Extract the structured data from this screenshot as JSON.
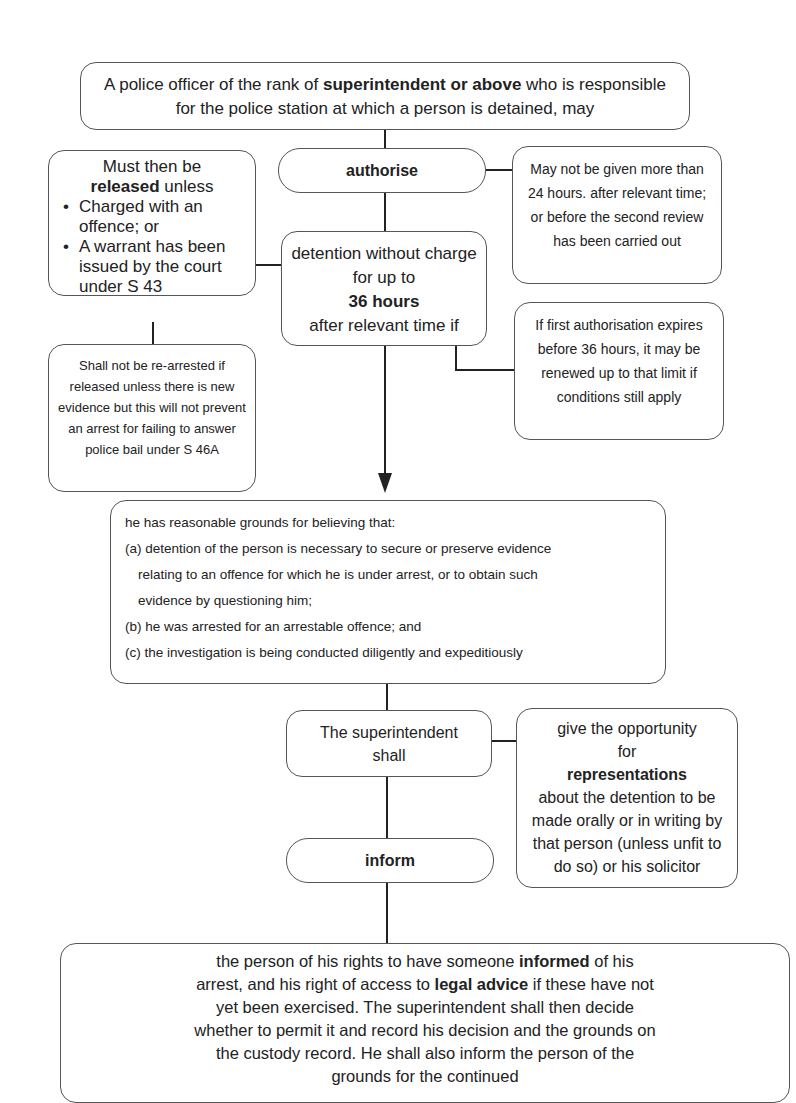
{
  "diagram": {
    "top_box": {
      "pre": "A police officer of the rank of ",
      "bold": "superintendent or above",
      "post": " who is responsible for the police station at which a person is detained, may"
    },
    "authorise_box": {
      "label": "authorise"
    },
    "release_box": {
      "line1": "Must then be",
      "bold": "released",
      "post": " unless",
      "bullets": [
        "Charged with an offence; or",
        "A warrant has been issued by the court under S 43"
      ]
    },
    "rearrest_box": {
      "text": "Shall not be re-arrested if released unless there is new evidence but this will not prevent an arrest for failing to answer police bail under S 46A"
    },
    "limit_box": {
      "text": "May not be given more than 24 hours. after relevant time; or before the second review has been carried out"
    },
    "detention_box": {
      "line1": "detention without charge for up to",
      "bold": "36 hours",
      "line3": "after relevant time if"
    },
    "renew_box": {
      "text": "If first authorisation expires before 36 hours, it may be renewed up to that limit if conditions still apply"
    },
    "grounds_box": {
      "intro": "he has reasonable grounds for believing that:",
      "items": [
        "(a) detention of the person is necessary to secure or preserve evidence",
        "relating to an offence for which he is under arrest, or to obtain such",
        "evidence by questioning him;",
        "(b) he was arrested for an arrestable offence; and",
        "(c) the investigation is being conducted diligently and expeditiously"
      ]
    },
    "superintendent_box": {
      "label": "The superintendent shall"
    },
    "representations_box": {
      "pre": "give the opportunity for",
      "bold": "representations",
      "post": "about the detention to be made orally or in writing by that person (unless unfit to do so) or his solicitor"
    },
    "inform_box": {
      "label": "inform"
    },
    "rights_box": {
      "p1": "the person of his rights to have someone ",
      "b1": "informed",
      "p2": " of his arrest, and his right of access to ",
      "b2": "legal advice",
      "p3": " if these have not yet been exercised. The superintendent shall then decide whether to permit it and record his decision and the grounds on the custody record. He shall also inform the person of the grounds for the continued"
    }
  }
}
